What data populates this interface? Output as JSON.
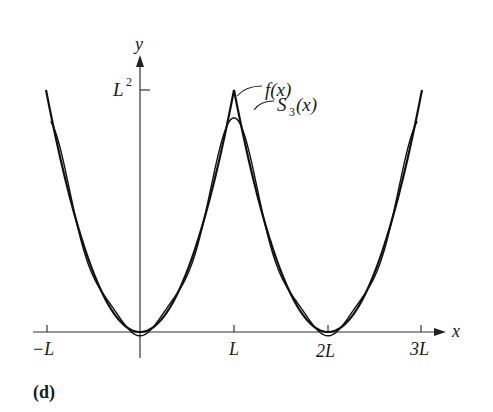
{
  "panel_label": "(d)",
  "chart_data": {
    "type": "line",
    "title": "",
    "xlabel": "x",
    "ylabel": "y",
    "x_ticks": [
      "-L",
      "L",
      "2L",
      "3L"
    ],
    "x_tick_values_in_L": [
      -1,
      1,
      2,
      3
    ],
    "y_ticks": [
      "L²"
    ],
    "y_tick_values_in_L2": [
      1
    ],
    "xlim_in_L": [
      -1.0,
      3.15
    ],
    "ylim_in_L2": [
      -0.05,
      1.1
    ],
    "grid": false,
    "legend": "inline annotations",
    "series": [
      {
        "name": "f(x)",
        "description": "x² on [-L, L], extended periodically with period 2L",
        "x_in_L": [
          -1,
          -0.5,
          0,
          0.5,
          1,
          1.5,
          2,
          2.5,
          3
        ],
        "y_in_L2": [
          1,
          0.25,
          0,
          0.25,
          1,
          0.25,
          0,
          0.25,
          1
        ]
      },
      {
        "name": "S₃(x)",
        "description": "3rd partial Fourier sum: L²/3 + Σ_{n=1..3} 4L²(-1)^n/(n²π²) cos(nπx/L)",
        "x_in_L": [
          -1,
          -0.5,
          0,
          0.5,
          1,
          1.5,
          2,
          2.5,
          3
        ],
        "y_in_L2": [
          0.903,
          0.232,
          -0.025,
          0.232,
          0.903,
          0.232,
          -0.025,
          0.232,
          0.903
        ]
      }
    ],
    "annotations": [
      {
        "text": "f(x)",
        "points_to": "peak of f at x = L"
      },
      {
        "text": "S₃(x)",
        "points_to": "S₃ curve right of x = L"
      }
    ]
  },
  "labels": {
    "x_axis": "x",
    "y_axis": "y",
    "y_tick": "L",
    "y_tick_sup": "2",
    "neg_L": "−L",
    "L": "L",
    "two_L": "2L",
    "three_L": "3L",
    "f": "f(x)",
    "s3_main": "S",
    "s3_sub": "3",
    "s3_tail": "(x)"
  }
}
